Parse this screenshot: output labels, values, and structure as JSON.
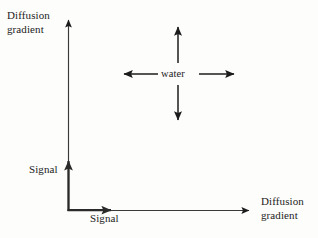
{
  "figure": {
    "type": "schematic-diagram",
    "background_color": "#fdfdfb",
    "stroke_color": "#1c1c1c",
    "labels": {
      "y_axis_top": {
        "line1": "Diffusion",
        "line2": "gradient"
      },
      "y_axis_inner": "Signal",
      "x_axis_inner": "Signal",
      "x_axis_right": {
        "line1": "Diffusion",
        "line2": "gradient"
      },
      "center": "water"
    },
    "axes": {
      "outer_vertical": {
        "label": "Diffusion gradient",
        "direction": "up",
        "weight": "thin"
      },
      "outer_horizontal": {
        "label": "Diffusion gradient",
        "direction": "right",
        "weight": "thin"
      },
      "inner_vertical": {
        "label": "Signal",
        "direction": "up",
        "weight": "bold"
      },
      "inner_horizontal": {
        "label": "Signal",
        "direction": "right",
        "weight": "bold"
      }
    },
    "diffusion_cross": {
      "center_label": "water",
      "arrow_directions": [
        "up",
        "down",
        "left",
        "right"
      ],
      "center_x": 178,
      "center_y": 74
    }
  }
}
